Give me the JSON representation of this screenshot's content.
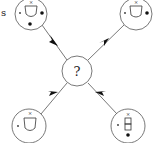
{
  "diagram": {
    "edge_label_partial": "s",
    "center": {
      "label": "?"
    },
    "nodes": [
      {
        "id": "top-left",
        "glyph": "cup",
        "marks": [
          "small-dot-left",
          "dot-right",
          "dot-bottom",
          "cross-top"
        ]
      },
      {
        "id": "top-right",
        "glyph": "cup",
        "marks": [
          "small-dot-left",
          "dot-right",
          "cross-top"
        ]
      },
      {
        "id": "bottom-left",
        "glyph": "cup",
        "marks": [
          "small-dot-left",
          "cross-top"
        ]
      },
      {
        "id": "bottom-right",
        "glyph": "stacked-boxes",
        "marks": [
          "small-dot-left",
          "dot-bottom",
          "cross-top"
        ]
      }
    ],
    "edges": [
      {
        "from": "top-left",
        "to": "center",
        "arrow": "toward-center"
      },
      {
        "from": "top-right",
        "to": "center",
        "arrow": "toward-center"
      },
      {
        "from": "bottom-left",
        "to": "center",
        "arrow": "toward-center"
      },
      {
        "from": "bottom-right",
        "to": "center",
        "arrow": "toward-center"
      }
    ]
  }
}
